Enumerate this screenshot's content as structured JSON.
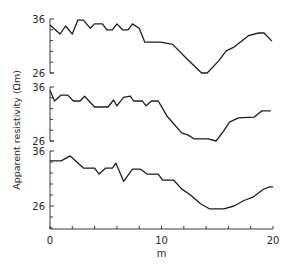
{
  "chart_data": {
    "type": "line",
    "title": "",
    "xlabel": "m",
    "ylabel": "Apparent resistivity (Ωm)",
    "xlim": [
      0,
      20
    ],
    "x_ticks": [
      0,
      2,
      4,
      6,
      8,
      10,
      12,
      14,
      16,
      18,
      20
    ],
    "x_tick_labels": [
      "0",
      "10",
      "20"
    ],
    "x_tick_label_values": [
      0,
      10,
      20
    ],
    "grid": false,
    "legend": null,
    "panels": [
      {
        "name": "top-profile",
        "ylim": [
          26,
          36
        ],
        "y_tick_labels": [
          "36",
          "26"
        ],
        "y_ticks": [
          26,
          28,
          30,
          32,
          34,
          36
        ],
        "x": [
          0.0,
          0.9,
          1.4,
          2.0,
          2.5,
          3.0,
          3.6,
          4.0,
          4.7,
          5.1,
          5.6,
          6.0,
          6.5,
          7.0,
          7.4,
          8.0,
          8.5,
          9.9,
          11.0,
          12.3,
          13.6,
          14.1,
          15.1,
          15.8,
          16.5,
          17.8,
          18.7,
          19.2,
          19.9
        ],
        "values": [
          34.9,
          33.2,
          34.7,
          33.2,
          35.8,
          35.8,
          34.3,
          35.1,
          35.1,
          34.0,
          34.0,
          35.1,
          34.0,
          34.0,
          35.1,
          34.3,
          31.7,
          31.7,
          31.3,
          28.6,
          26.0,
          26.0,
          28.2,
          30.1,
          30.8,
          32.9,
          33.4,
          33.4,
          31.9
        ]
      },
      {
        "name": "middle-profile",
        "ylim": [
          26,
          36
        ],
        "y_tick_labels": [
          "36",
          "26"
        ],
        "y_ticks": [
          26,
          28,
          30,
          32,
          34,
          36
        ],
        "x": [
          0.0,
          0.4,
          1.0,
          1.6,
          2.1,
          2.7,
          3.1,
          4.0,
          5.2,
          5.7,
          6.0,
          6.6,
          7.2,
          7.5,
          8.3,
          8.6,
          9.1,
          9.7,
          10.5,
          11.8,
          12.4,
          12.9,
          14.2,
          14.9,
          15.6,
          16.1,
          16.9,
          18.3,
          19.0,
          19.8
        ],
        "values": [
          35.4,
          33.4,
          34.5,
          34.5,
          33.4,
          33.4,
          34.3,
          32.3,
          32.3,
          33.6,
          32.5,
          34.1,
          34.3,
          33.4,
          33.4,
          32.5,
          33.4,
          33.4,
          30.6,
          27.5,
          27.1,
          26.4,
          26.4,
          26.0,
          27.9,
          29.5,
          30.3,
          30.4,
          31.6,
          31.6
        ]
      },
      {
        "name": "bottom-profile",
        "ylim": [
          22,
          36
        ],
        "y_tick_labels": [
          "36",
          "26"
        ],
        "y_ticks": [
          22,
          24,
          26,
          28,
          30,
          32,
          34,
          36
        ],
        "x": [
          0.0,
          1.0,
          1.8,
          3.0,
          4.0,
          4.4,
          5.0,
          5.6,
          5.9,
          6.6,
          7.4,
          8.1,
          8.7,
          9.7,
          10.1,
          11.1,
          11.8,
          12.6,
          13.5,
          14.3,
          15.6,
          16.5,
          17.4,
          18.2,
          19.1,
          19.7,
          20.0
        ],
        "values": [
          34.2,
          34.2,
          35.1,
          32.9,
          32.9,
          31.8,
          32.9,
          32.9,
          33.8,
          30.5,
          32.7,
          32.7,
          31.8,
          31.8,
          30.7,
          30.7,
          29.1,
          28.0,
          26.4,
          25.5,
          25.5,
          26.0,
          27.0,
          27.6,
          29.0,
          29.5,
          29.5
        ]
      }
    ]
  },
  "labels": {
    "ylabel": "Apparent resistivity (Ωm)",
    "xlabel": "m",
    "panel_top_36": "36",
    "panel_top_26": "26",
    "panel_mid_36": "36",
    "panel_mid_26": "26",
    "panel_bot_36": "36",
    "panel_bot_26": "26",
    "x0": "0",
    "x10": "10",
    "x20": "20"
  },
  "style": {
    "line_color": "#1e1e1e",
    "axis_color": "#3a3a3a",
    "text_color": "#2a2a2a"
  }
}
